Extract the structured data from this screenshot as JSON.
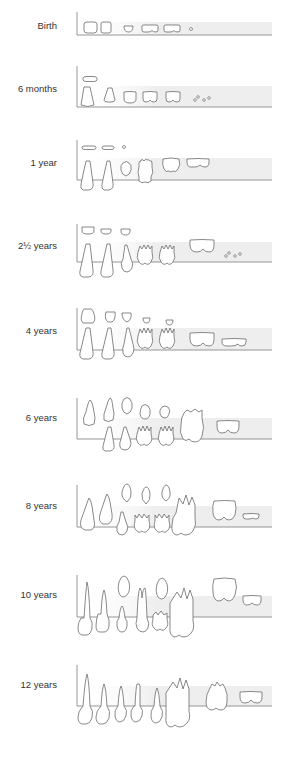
{
  "diagram": {
    "colors": {
      "outline": "#6b6b6b",
      "axis": "#8a8a8a",
      "gumline_band": "#ececec",
      "label": "#333333"
    },
    "stages": [
      {
        "label": "Birth",
        "label_y": 25,
        "axis_top": 12,
        "baseline": 35
      },
      {
        "label": "6 months",
        "label_y": 88,
        "axis_top": 66,
        "baseline": 107
      },
      {
        "label": "1 year",
        "label_y": 162,
        "axis_top": 140,
        "baseline": 180
      },
      {
        "label": "2½ years",
        "label_y": 245,
        "axis_top": 225,
        "baseline": 262
      },
      {
        "label": "4 years",
        "label_y": 330,
        "axis_top": 308,
        "baseline": 350
      },
      {
        "label": "6 years",
        "label_y": 417,
        "axis_top": 398,
        "baseline": 439
      },
      {
        "label": "8 years",
        "label_y": 505,
        "axis_top": 485,
        "baseline": 527
      },
      {
        "label": "10 years",
        "label_y": 594,
        "axis_top": 575,
        "baseline": 617
      },
      {
        "label": "12 years",
        "label_y": 684,
        "axis_top": 665,
        "baseline": 706
      }
    ]
  }
}
